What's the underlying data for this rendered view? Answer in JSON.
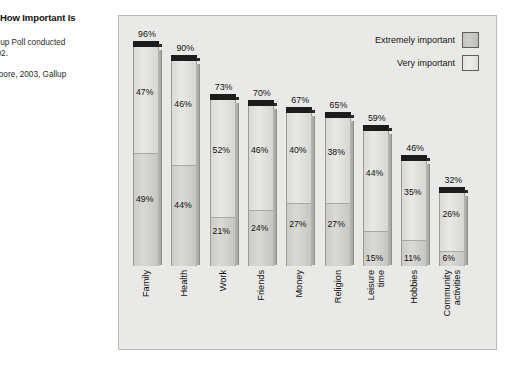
{
  "caption": {
    "title": "How Important Is",
    "source": "allup Poll conducted\n002.",
    "source_line1": "allup Poll conducted",
    "source_line2": "002.",
    "credit": "Moore, 2003, Gallup"
  },
  "legend": {
    "items": [
      {
        "label": "Extremely important",
        "swatch": "dark-gray",
        "color": "#c8c8c5"
      },
      {
        "label": "Very important",
        "swatch": "light-gray",
        "color": "#e8e8e5"
      }
    ]
  },
  "chart_data": {
    "type": "bar",
    "subtype": "stacked-bar",
    "title": "How Important Is",
    "xlabel": "",
    "ylabel": "",
    "ylim": [
      0,
      100
    ],
    "grid": false,
    "legend_position": "top-right",
    "value_suffix": "%",
    "categories": [
      "Family",
      "Health",
      "Work",
      "Friends",
      "Money",
      "Religion",
      "Leisure time",
      "Hobbies",
      "Community activities"
    ],
    "series": [
      {
        "name": "Very important",
        "values": [
          47,
          46,
          52,
          46,
          40,
          38,
          44,
          35,
          26
        ]
      },
      {
        "name": "Extremely important",
        "values": [
          49,
          44,
          21,
          24,
          27,
          27,
          15,
          11,
          6
        ]
      }
    ],
    "totals": [
      96,
      90,
      73,
      70,
      67,
      65,
      59,
      46,
      32
    ],
    "bars": [
      {
        "category": "Family",
        "label_lines": [
          "Family"
        ],
        "total": "96%",
        "very": "47%",
        "extremely": "49%",
        "total_value": 96,
        "very_value": 47,
        "extremely_value": 49
      },
      {
        "category": "Health",
        "label_lines": [
          "Health"
        ],
        "total": "90%",
        "very": "46%",
        "extremely": "44%",
        "total_value": 90,
        "very_value": 46,
        "extremely_value": 44
      },
      {
        "category": "Work",
        "label_lines": [
          "Work"
        ],
        "total": "73%",
        "very": "52%",
        "extremely": "21%",
        "total_value": 73,
        "very_value": 52,
        "extremely_value": 21
      },
      {
        "category": "Friends",
        "label_lines": [
          "Friends"
        ],
        "total": "70%",
        "very": "46%",
        "extremely": "24%",
        "total_value": 70,
        "very_value": 46,
        "extremely_value": 24
      },
      {
        "category": "Money",
        "label_lines": [
          "Money"
        ],
        "total": "67%",
        "very": "40%",
        "extremely": "27%",
        "total_value": 67,
        "very_value": 40,
        "extremely_value": 27
      },
      {
        "category": "Religion",
        "label_lines": [
          "Religion"
        ],
        "total": "65%",
        "very": "38%",
        "extremely": "27%",
        "total_value": 65,
        "very_value": 38,
        "extremely_value": 27
      },
      {
        "category": "Leisure time",
        "label_lines": [
          "Leisure",
          "time"
        ],
        "total": "59%",
        "very": "44%",
        "extremely": "15%",
        "total_value": 59,
        "very_value": 44,
        "extremely_value": 15
      },
      {
        "category": "Hobbies",
        "label_lines": [
          "Hobbies"
        ],
        "total": "46%",
        "very": "35%",
        "extremely": "11%",
        "total_value": 46,
        "very_value": 35,
        "extremely_value": 11
      },
      {
        "category": "Community activities",
        "label_lines": [
          "Community",
          "activities"
        ],
        "total": "32%",
        "very": "26%",
        "extremely": "6%",
        "total_value": 32,
        "very_value": 26,
        "extremely_value": 6
      }
    ]
  }
}
